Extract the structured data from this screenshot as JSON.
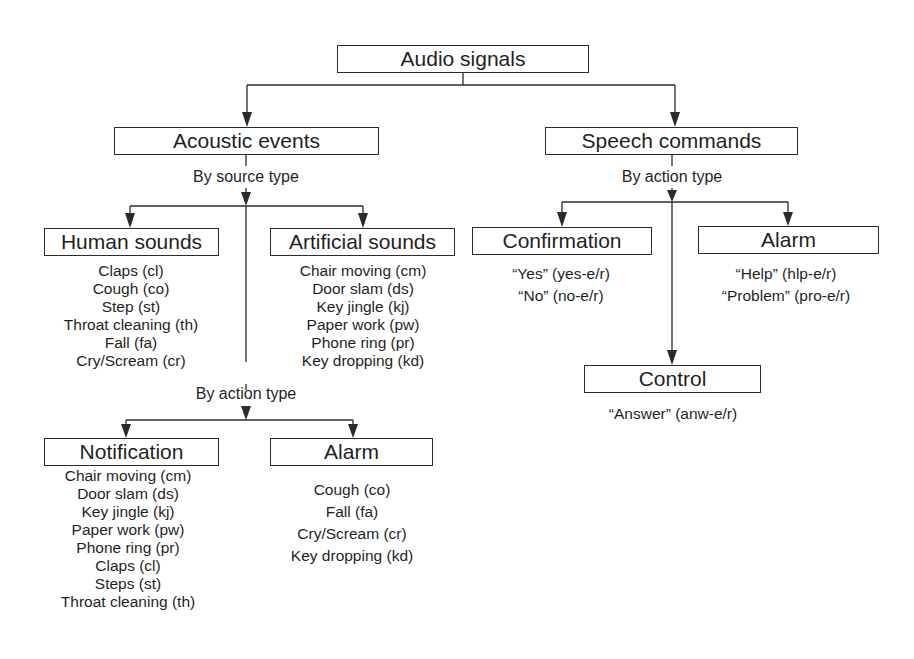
{
  "diagram": {
    "root": {
      "label": "Audio signals"
    },
    "acoustic_events": {
      "label": "Acoustic events",
      "split_label": "By source type",
      "human_sounds": {
        "label": "Human sounds",
        "items": [
          "Claps (cl)",
          "Cough (co)",
          "Step (st)",
          "Throat cleaning (th)",
          "Fall (fa)",
          "Cry/Scream (cr)"
        ]
      },
      "artificial_sounds": {
        "label": "Artificial sounds",
        "items": [
          "Chair moving (cm)",
          "Door slam (ds)",
          "Key jingle (kj)",
          "Paper work (pw)",
          "Phone ring (pr)",
          "Key dropping (kd)"
        ]
      },
      "action_split_label": "By action type",
      "notification": {
        "label": "Notification",
        "items": [
          "Chair moving (cm)",
          "Door slam (ds)",
          "Key jingle (kj)",
          "Paper work (pw)",
          "Phone ring (pr)",
          "Claps (cl)",
          "Steps (st)",
          "Throat cleaning (th)"
        ]
      },
      "alarm": {
        "label": "Alarm",
        "items": [
          "Cough (co)",
          "Fall (fa)",
          "Cry/Scream (cr)",
          "Key dropping (kd)"
        ]
      }
    },
    "speech_commands": {
      "label": "Speech commands",
      "split_label": "By action type",
      "confirmation": {
        "label": "Confirmation",
        "items": [
          "“Yes” (yes-e/r)",
          "“No” (no-e/r)"
        ]
      },
      "alarm": {
        "label": "Alarm",
        "items": [
          "“Help” (hlp-e/r)",
          "“Problem” (pro-e/r)"
        ]
      },
      "control": {
        "label": "Control",
        "items": [
          "“Answer” (anw-e/r)"
        ]
      }
    },
    "colors": {
      "line": "#2b2b2b",
      "text": "#1f1f1f",
      "background": "#ffffff"
    }
  }
}
